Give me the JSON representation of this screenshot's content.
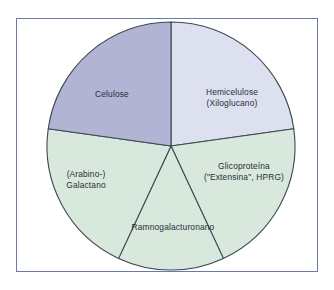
{
  "figure": {
    "frame_color": "#6b7aa8",
    "background": "#ffffff",
    "outline_color": "#3a4a52"
  },
  "chart_data": {
    "type": "pie",
    "title": "",
    "subtitle": "",
    "xlabel": "",
    "ylabel": "",
    "legend": "none",
    "grid": false,
    "units": "percent of wall composition",
    "center": {
      "x": 171,
      "y": 146
    },
    "radius": 124,
    "start_angle_deg": 0,
    "direction": "clockwise",
    "categories": [
      "Hemicelulose (Xiloglucano)",
      "Glicoproteína (\"Extensina\", HPRG)",
      "Ramnogalacturonano",
      "(Arabino-) Galactano",
      "Celulose"
    ],
    "values": [
      22.8,
      20.3,
      13.9,
      20.3,
      22.8
    ],
    "angles_deg": [
      82,
      73,
      50,
      73,
      82
    ],
    "colors": [
      "#dde0ee",
      "#d8e8dc",
      "#d8e8dc",
      "#d8e8dc",
      "#b2b4d4"
    ],
    "slices": [
      {
        "name": "hemicelulose",
        "label_lines": [
          "Hemicelulose",
          "(Xiloglucano)"
        ],
        "value": 22.8,
        "angle_deg": 82,
        "start_deg": 0,
        "end_deg": 82,
        "color": "#dde0ee",
        "label_x": 232,
        "label_y": 93
      },
      {
        "name": "glicoproteina",
        "label_lines": [
          "Glicoproteína",
          "(\"Extensina\", HPRG)"
        ],
        "value": 20.3,
        "angle_deg": 73,
        "start_deg": 82,
        "end_deg": 155,
        "color": "#d8e8dc",
        "label_x": 244,
        "label_y": 167
      },
      {
        "name": "ramnogalacturonano",
        "label_lines": [
          "Ramnogalacturonano"
        ],
        "value": 13.9,
        "angle_deg": 50,
        "start_deg": 155,
        "end_deg": 205,
        "color": "#d8e8dc",
        "label_x": 173,
        "label_y": 228
      },
      {
        "name": "arabino-galactano",
        "label_lines": [
          "(Arabino-)",
          "Galactano"
        ],
        "value": 20.3,
        "angle_deg": 73,
        "start_deg": 205,
        "end_deg": 278,
        "color": "#d8e8dc",
        "label_x": 86,
        "label_y": 175
      },
      {
        "name": "celulose",
        "label_lines": [
          "Celulose"
        ],
        "value": 22.8,
        "angle_deg": 82,
        "start_deg": 278,
        "end_deg": 360,
        "color": "#b2b4d4",
        "label_x": 112,
        "label_y": 95
      }
    ]
  }
}
